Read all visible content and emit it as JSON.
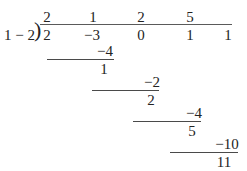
{
  "problem": {
    "divisor": "1 − 2",
    "bracket_glyph": ")",
    "quotient": [
      {
        "text": "2",
        "x": 47,
        "y": 10
      },
      {
        "text": "1",
        "x": 93,
        "y": 10
      },
      {
        "text": "2",
        "x": 141,
        "y": 10
      },
      {
        "text": "5",
        "x": 190,
        "y": 10
      }
    ],
    "dividend": [
      {
        "text": "2",
        "x": 47,
        "y": 28
      },
      {
        "text": "−3",
        "x": 92,
        "y": 28
      },
      {
        "text": "0",
        "x": 141,
        "y": 28
      },
      {
        "text": "1",
        "x": 190,
        "y": 28
      },
      {
        "text": "1",
        "x": 228,
        "y": 28
      }
    ],
    "steps": [
      {
        "subtract": "−4",
        "subtract_x": 105,
        "subtract_y": 44,
        "rule_x": 47,
        "rule_y": 59,
        "rule_w": 67,
        "remainder": "1",
        "remainder_x": 104,
        "remainder_y": 62
      },
      {
        "subtract": "−2",
        "subtract_x": 152,
        "subtract_y": 75,
        "rule_x": 92,
        "rule_y": 90,
        "rule_w": 67,
        "remainder": "2",
        "remainder_x": 151,
        "remainder_y": 93
      },
      {
        "subtract": "−4",
        "subtract_x": 194,
        "subtract_y": 106,
        "rule_x": 133,
        "rule_y": 121,
        "rule_w": 68,
        "remainder": "5",
        "remainder_x": 192,
        "remainder_y": 124
      },
      {
        "subtract": "−10",
        "subtract_x": 227,
        "subtract_y": 137,
        "rule_x": 170,
        "rule_y": 152,
        "rule_w": 68,
        "remainder": "11",
        "remainder_x": 224,
        "remainder_y": 155
      }
    ],
    "vinculum": {
      "x": 40,
      "y": 24,
      "w": 192
    },
    "divisor_pos": {
      "x": 4,
      "y": 28
    },
    "bracket_pos": {
      "x": 34,
      "y": 24
    }
  }
}
